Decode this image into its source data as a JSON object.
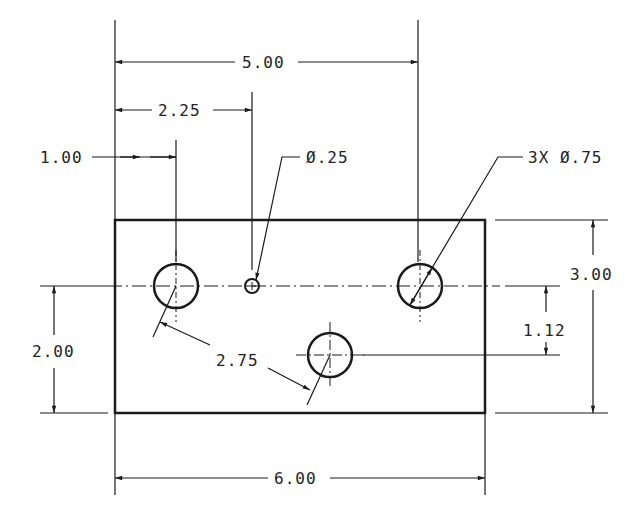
{
  "drawing": {
    "type": "engineering-drawing",
    "part": {
      "width": "6.00",
      "height": "3.00"
    },
    "dimensions": {
      "overall_width": "6.00",
      "overall_height": "3.00",
      "hole_row_height": "2.00",
      "hole_offset_vertical": "1.12",
      "first_hole_x": "1.00",
      "small_hole_x": "2.25",
      "third_hole_x": "5.00",
      "radial_distance": "2.75"
    },
    "callouts": {
      "small_hole": "Ø.25",
      "large_holes": "3X Ø.75"
    },
    "colors": {
      "line": "#1a1a1a",
      "background": "#ffffff"
    }
  }
}
